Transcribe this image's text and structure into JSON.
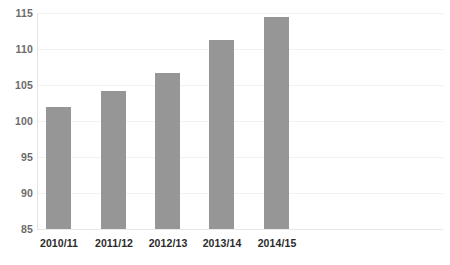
{
  "chart_data": {
    "type": "bar",
    "title": "",
    "subtitle": "",
    "xlabel": "",
    "ylabel": "",
    "categories": [
      "2010/11",
      "2011/12",
      "2012/13",
      "2013/14",
      "2014/15"
    ],
    "values": [
      101.9,
      104.2,
      106.6,
      111.3,
      114.4
    ],
    "series": [
      {
        "name": "",
        "values": [
          101.9,
          104.2,
          106.6,
          111.3,
          114.4
        ],
        "color": "#969696"
      }
    ],
    "ylim": [
      85,
      115
    ],
    "yticks": [
      85,
      90,
      95,
      100,
      105,
      110,
      115
    ],
    "ytick_labels": [
      "85",
      "90",
      "95",
      "100",
      "105",
      "110",
      "115"
    ],
    "xtick_labels": [
      "2010/11",
      "2011/12",
      "2012/13",
      "2013/14",
      "2014/15"
    ],
    "grid": true,
    "grid_axis": "y",
    "legend": false,
    "legend_position": "none",
    "annotations": [],
    "colors": {
      "bar": "#969696",
      "gridline": "#f2f2f2",
      "axis": "#e4e4e4",
      "ytick_text": "#6b6b6b",
      "xtick_text": "#2b2b2b",
      "background": "#ffffff"
    }
  }
}
